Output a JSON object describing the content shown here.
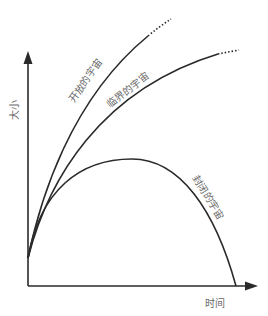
{
  "diagram": {
    "axes": {
      "x_label": "时间",
      "y_label": "大小"
    },
    "curves": [
      {
        "id": "open",
        "label": "开放的宇宙",
        "style": "solid-then-dotted"
      },
      {
        "id": "critical",
        "label": "临界的宇宙",
        "style": "solid-then-dotted"
      },
      {
        "id": "closed",
        "label": "封闭的宇宙",
        "style": "solid"
      }
    ],
    "colors": {
      "line": "#2a2a2a",
      "text": "#6a6a6a",
      "background": "#ffffff"
    }
  }
}
